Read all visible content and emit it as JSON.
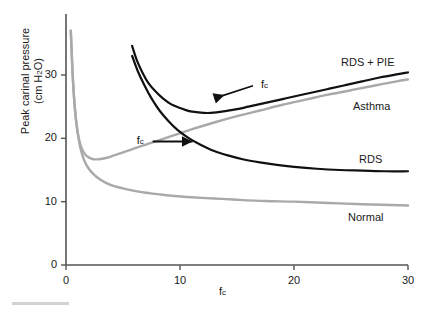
{
  "chart_data": {
    "type": "line",
    "title": "",
    "xlabel": "fc",
    "xlabel_main": "f",
    "xlabel_sub": "c",
    "ylabel_line1": "Peak carinal pressure",
    "ylabel_line2": "(cm H2O)",
    "ylabel_line2_main": "(cm H",
    "ylabel_line2_sub": "2",
    "ylabel_line2_tail": "O)",
    "xlim": [
      0,
      30
    ],
    "ylim": [
      0,
      37
    ],
    "xticks": [
      0,
      10,
      20,
      30
    ],
    "xtick_labels": [
      "0",
      "10",
      "20",
      "30"
    ],
    "yticks": [
      0,
      10,
      20,
      30
    ],
    "ytick_labels": [
      "0",
      "10",
      "20",
      "30"
    ],
    "grid": false,
    "legend_position": "inline-right",
    "series": [
      {
        "name": "RDS + PIE",
        "color": "#111111",
        "width": 2.2,
        "label_x": 30.2,
        "label_y": 32.0,
        "points": [
          [
            5.8,
            34.6
          ],
          [
            6.2,
            32.4
          ],
          [
            6.7,
            30.4
          ],
          [
            7.2,
            28.8
          ],
          [
            7.8,
            27.5
          ],
          [
            8.5,
            26.3
          ],
          [
            9.2,
            25.4
          ],
          [
            10.0,
            24.8
          ],
          [
            10.8,
            24.3
          ],
          [
            11.6,
            24.1
          ],
          [
            12.4,
            24.0
          ],
          [
            13.2,
            24.1
          ],
          [
            14.0,
            24.3
          ],
          [
            15.0,
            24.6
          ],
          [
            16.0,
            25.0
          ],
          [
            17.0,
            25.4
          ],
          [
            18.0,
            25.8
          ],
          [
            19.0,
            26.2
          ],
          [
            20.0,
            26.6
          ],
          [
            21.5,
            27.2
          ],
          [
            23.0,
            27.8
          ],
          [
            24.5,
            28.4
          ],
          [
            26.0,
            29.0
          ],
          [
            27.5,
            29.6
          ],
          [
            29.0,
            30.1
          ],
          [
            30.0,
            30.4
          ]
        ]
      },
      {
        "name": "RDS",
        "color": "#111111",
        "width": 2.2,
        "label_x": 27.0,
        "label_y": 16.8,
        "points": [
          [
            5.8,
            33.0
          ],
          [
            6.3,
            30.6
          ],
          [
            6.9,
            28.3
          ],
          [
            7.5,
            26.3
          ],
          [
            8.2,
            24.4
          ],
          [
            9.0,
            22.7
          ],
          [
            9.8,
            21.3
          ],
          [
            10.8,
            20.0
          ],
          [
            11.8,
            19.0
          ],
          [
            13.0,
            18.0
          ],
          [
            14.2,
            17.3
          ],
          [
            15.5,
            16.7
          ],
          [
            17.0,
            16.2
          ],
          [
            18.5,
            15.8
          ],
          [
            20.0,
            15.5
          ],
          [
            22.0,
            15.2
          ],
          [
            24.0,
            15.0
          ],
          [
            26.0,
            14.9
          ],
          [
            28.0,
            14.8
          ],
          [
            30.0,
            14.8
          ]
        ]
      },
      {
        "name": "Asthma",
        "color": "#a9a9a9",
        "width": 2.4,
        "label_x": 30.2,
        "label_y": 25.0,
        "points": [
          [
            0.42,
            37.0
          ],
          [
            0.5,
            33.5
          ],
          [
            0.6,
            29.5
          ],
          [
            0.72,
            26.0
          ],
          [
            0.85,
            23.3
          ],
          [
            1.0,
            21.2
          ],
          [
            1.2,
            19.4
          ],
          [
            1.4,
            18.3
          ],
          [
            1.7,
            17.4
          ],
          [
            2.0,
            17.0
          ],
          [
            2.4,
            16.7
          ],
          [
            2.9,
            16.7
          ],
          [
            3.5,
            16.9
          ],
          [
            4.2,
            17.3
          ],
          [
            5.0,
            17.8
          ],
          [
            6.0,
            18.4
          ],
          [
            7.0,
            19.0
          ],
          [
            8.0,
            19.6
          ],
          [
            9.5,
            20.5
          ],
          [
            11.0,
            21.4
          ],
          [
            13.0,
            22.5
          ],
          [
            15.0,
            23.5
          ],
          [
            17.0,
            24.4
          ],
          [
            19.0,
            25.3
          ],
          [
            21.0,
            26.1
          ],
          [
            23.0,
            26.9
          ],
          [
            25.0,
            27.6
          ],
          [
            27.0,
            28.3
          ],
          [
            29.0,
            29.0
          ],
          [
            30.0,
            29.3
          ]
        ]
      },
      {
        "name": "Normal",
        "color": "#a9a9a9",
        "width": 2.4,
        "label_x": 26.0,
        "label_y": 8.5,
        "points": [
          [
            0.42,
            37.0
          ],
          [
            0.5,
            33.5
          ],
          [
            0.6,
            29.5
          ],
          [
            0.75,
            25.5
          ],
          [
            0.9,
            22.6
          ],
          [
            1.1,
            20.0
          ],
          [
            1.3,
            18.2
          ],
          [
            1.6,
            16.5
          ],
          [
            2.0,
            15.2
          ],
          [
            2.5,
            14.2
          ],
          [
            3.0,
            13.5
          ],
          [
            3.6,
            12.9
          ],
          [
            4.3,
            12.4
          ],
          [
            5.0,
            12.1
          ],
          [
            6.0,
            11.7
          ],
          [
            7.0,
            11.4
          ],
          [
            8.0,
            11.2
          ],
          [
            9.5,
            10.9
          ],
          [
            11.0,
            10.7
          ],
          [
            13.0,
            10.5
          ],
          [
            15.0,
            10.3
          ],
          [
            17.5,
            10.1
          ],
          [
            20.0,
            10.0
          ],
          [
            23.0,
            9.8
          ],
          [
            26.0,
            9.6
          ],
          [
            30.0,
            9.4
          ]
        ]
      }
    ],
    "annotations": [
      {
        "name": "fc-upper",
        "text": "fc",
        "text_main": "f",
        "text_sub": "c",
        "label_x": 17.1,
        "label_y": 28.3,
        "arrow_from_x": 16.4,
        "arrow_from_y": 28.3,
        "arrow_to_x": 13.0,
        "arrow_to_y": 26.3
      },
      {
        "name": "fc-lower",
        "text": "fc",
        "text_main": "f",
        "text_sub": "c",
        "label_x": 6.2,
        "label_y": 19.5,
        "arrow_from_x": 7.6,
        "arrow_from_y": 19.5,
        "arrow_to_x": 11.1,
        "arrow_to_y": 19.5
      }
    ]
  },
  "axes": {
    "y_title_line1": "Peak carinal pressure",
    "y_title_line2_pre": "(cm H",
    "y_title_line2_sub": "2",
    "y_title_line2_post": "O)",
    "x_title_main": "f",
    "x_title_sub": "c"
  },
  "ticks": {
    "x": [
      "0",
      "10",
      "20",
      "30"
    ],
    "y": [
      "0",
      "10",
      "20",
      "30"
    ]
  },
  "series_labels": {
    "rds_pie": "RDS + PIE",
    "asthma": "Asthma",
    "rds": "RDS",
    "normal": "Normal"
  },
  "annotation_labels": {
    "fc_upper_main": "f",
    "fc_upper_sub": "c",
    "fc_lower_main": "f",
    "fc_lower_sub": "c"
  }
}
